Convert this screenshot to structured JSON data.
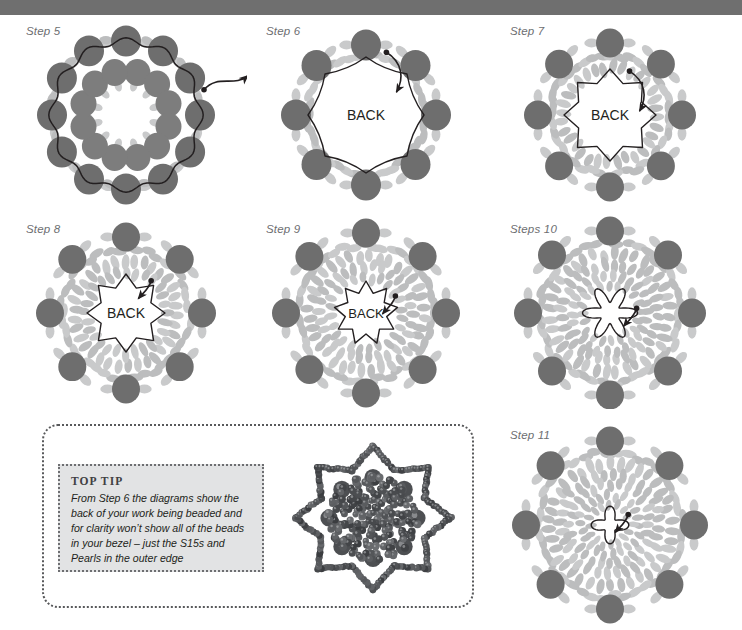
{
  "page": {
    "background_color": "#ffffff",
    "top_band_color": "#6f6f6f"
  },
  "palette": {
    "pearl_bead": "#6e6e6e",
    "pearl_bead_shadow": "#7d7d7d",
    "seed_bead": "#c9cacb",
    "seed_bead_dark": "#bcbdbe",
    "thread": "#231f20",
    "label_text": "#6d6e71",
    "back_text": "#231f20",
    "tip_panel_border": "#58595b",
    "tip_box_fill": "#e2e3e4",
    "tip_box_border": "#6d6e71",
    "tip_title_text": "#414042",
    "tip_body_text": "#231f20",
    "photo_bead_dark": "#3f4042",
    "photo_bead_light": "#8e9094"
  },
  "diagrams": [
    {
      "id": "step5",
      "label": "Step 5",
      "center_text": "",
      "outer_pearls": 12,
      "inner_pearls": 12,
      "pearl_radius": 15,
      "inner_pearl_radius": 13,
      "outer_ring_radius": 74,
      "inner_ring_radius": 44,
      "seed_rings": [],
      "spacer_ring": {
        "radius": 74,
        "count": 12,
        "size": 7
      },
      "inner_spacer_ring": {
        "radius": 30,
        "count": 12,
        "size": 6
      },
      "thread_ring_radius": 74,
      "thread_style": "scallop-outer",
      "arrow": "outer-right-exit",
      "arrow_angle": -18
    },
    {
      "id": "step6",
      "label": "Step 6",
      "center_text": "BACK",
      "outer_pearls": 8,
      "inner_pearls": 0,
      "pearl_radius": 15,
      "outer_ring_radius": 70,
      "seed_rings": [
        {
          "radius": 59,
          "count": 40,
          "size": 7,
          "tilt": "tangent"
        }
      ],
      "thread_ring_radius": 58,
      "thread_style": "octagon-scallop",
      "arrow": "inward-curve",
      "arrow_angle": -72
    },
    {
      "id": "step7",
      "label": "Step 7",
      "center_text": "BACK",
      "outer_pearls": 8,
      "inner_pearls": 0,
      "pearl_radius": 14,
      "outer_ring_radius": 72,
      "seed_rings": [
        {
          "radius": 60,
          "count": 40,
          "size": 7,
          "tilt": "tangent"
        },
        {
          "radius": 47,
          "count": 32,
          "size": 7,
          "tilt": "radial"
        }
      ],
      "thread_ring_radius": 40,
      "thread_style": "star8",
      "arrow": "inward-curve",
      "arrow_angle": -66
    },
    {
      "id": "step8",
      "label": "Step 8",
      "center_text": "BACK",
      "outer_pearls": 8,
      "inner_pearls": 0,
      "pearl_radius": 14,
      "outer_ring_radius": 76,
      "seed_rings": [
        {
          "radius": 64,
          "count": 40,
          "size": 7,
          "tilt": "tangent"
        },
        {
          "radius": 52,
          "count": 34,
          "size": 7,
          "tilt": "radial"
        },
        {
          "radius": 41,
          "count": 28,
          "size": 6.5,
          "tilt": "radial"
        }
      ],
      "thread_ring_radius": 33,
      "thread_style": "star8",
      "arrow": "inward-short",
      "arrow_angle": -52
    },
    {
      "id": "step9",
      "label": "Step 9",
      "center_text": "BACK",
      "outer_pearls": 8,
      "inner_pearls": 0,
      "pearl_radius": 14,
      "outer_ring_radius": 80,
      "seed_rings": [
        {
          "radius": 68,
          "count": 42,
          "size": 7,
          "tilt": "tangent"
        },
        {
          "radius": 57,
          "count": 36,
          "size": 7,
          "tilt": "radial"
        },
        {
          "radius": 46,
          "count": 30,
          "size": 6.5,
          "tilt": "radial"
        },
        {
          "radius": 36,
          "count": 24,
          "size": 6,
          "tilt": "radial"
        }
      ],
      "thread_ring_radius": 26,
      "thread_style": "star10",
      "arrow": "inward-short",
      "arrow_angle": -30
    },
    {
      "id": "step10",
      "label": "Steps 10",
      "center_text": "",
      "outer_pearls": 8,
      "inner_pearls": 0,
      "pearl_radius": 14,
      "outer_ring_radius": 82,
      "seed_rings": [
        {
          "radius": 70,
          "count": 42,
          "size": 7,
          "tilt": "tangent"
        },
        {
          "radius": 59,
          "count": 36,
          "size": 7,
          "tilt": "radial"
        },
        {
          "radius": 48,
          "count": 32,
          "size": 6.5,
          "tilt": "radial"
        },
        {
          "radius": 38,
          "count": 26,
          "size": 6,
          "tilt": "radial"
        },
        {
          "radius": 28,
          "count": 20,
          "size": 5.5,
          "tilt": "radial"
        }
      ],
      "thread_ring_radius": 19,
      "thread_style": "flower6",
      "arrow": "inward-short",
      "arrow_angle": -10
    },
    {
      "id": "step11",
      "label": "Step 11",
      "center_text": "",
      "outer_pearls": 8,
      "inner_pearls": 0,
      "pearl_radius": 14,
      "outer_ring_radius": 84,
      "seed_rings": [
        {
          "radius": 72,
          "count": 42,
          "size": 7,
          "tilt": "tangent"
        },
        {
          "radius": 61,
          "count": 38,
          "size": 7,
          "tilt": "radial"
        },
        {
          "radius": 50,
          "count": 32,
          "size": 6.5,
          "tilt": "radial"
        },
        {
          "radius": 40,
          "count": 28,
          "size": 6,
          "tilt": "radial"
        },
        {
          "radius": 30,
          "count": 22,
          "size": 5.5,
          "tilt": "radial"
        },
        {
          "radius": 21,
          "count": 16,
          "size": 5,
          "tilt": "radial"
        }
      ],
      "thread_ring_radius": 13,
      "thread_style": "flower4",
      "arrow": "inward-short",
      "arrow_angle": -30
    }
  ],
  "tip": {
    "title": "TOP TIP",
    "body": "From Step 6 the diagrams show the back of your work being beaded and for clarity won’t show all of the beads in your bezel – just the S15s and Pearls in the outer edge",
    "photo_alt": "finished beaded star rosette component"
  },
  "center_label": "BACK"
}
